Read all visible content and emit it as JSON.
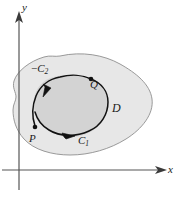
{
  "figure": {
    "background_color": "#ffffff",
    "axes": {
      "x_label": "x",
      "y_label": "y",
      "axis_color": "#4a4a4a",
      "origin_x": 19,
      "origin_y": 170,
      "x_axis_end": 165,
      "y_axis_top": 14
    },
    "region_outer": {
      "name": "D",
      "label": "D",
      "fill_color": "#e6e6e6",
      "stroke_color": "#8c8c8c"
    },
    "region_inner": {
      "fill_color": "#d2d2d2",
      "stroke_color": "#141414"
    },
    "curves": [
      {
        "name": "C1",
        "label_text": "C",
        "label_sub": "1",
        "sign": "",
        "direction": "clockwise-lower"
      },
      {
        "name": "-C2",
        "label_text": "C",
        "label_sub": "2",
        "sign": "−",
        "direction": "clockwise-upper"
      }
    ],
    "points": [
      {
        "name": "P",
        "label": "P",
        "x": 35,
        "y": 128
      },
      {
        "name": "Q",
        "label": "Q",
        "x": 91,
        "y": 86
      }
    ],
    "labels": {
      "y_axis": "y",
      "x_axis": "x",
      "neg_c2_sign": "−",
      "neg_c2_base": "C",
      "neg_c2_sub": "2",
      "c1_base": "C",
      "c1_sub": "1",
      "point_p": "P",
      "point_q": "Q",
      "region_d": "D"
    }
  }
}
